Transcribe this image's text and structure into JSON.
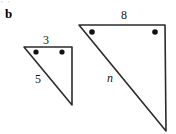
{
  "figure": {
    "part_label": "b",
    "top_crop_artifact": "1-4",
    "background_color": "#ffffff",
    "stroke_color": "#2b2b2b",
    "marker_color": "#111111",
    "label_color": "#151515",
    "small_triangle": {
      "name": "small-triangle",
      "vertices": [
        [
          24,
          47
        ],
        [
          72,
          47
        ],
        [
          72,
          105
        ]
      ],
      "side_labels": [
        {
          "text": "3",
          "x": 45,
          "y": 40,
          "side": "top"
        },
        {
          "text": "5",
          "x": 38,
          "y": 80,
          "side": "hypotenuse"
        }
      ],
      "angle_markers": [
        {
          "x": 36,
          "y": 52
        },
        {
          "x": 62,
          "y": 52
        }
      ]
    },
    "large_triangle": {
      "name": "large-triangle",
      "vertices": [
        [
          79,
          25
        ],
        [
          165,
          25
        ],
        [
          166,
          131
        ]
      ],
      "side_labels": [
        {
          "text": "8",
          "x": 124,
          "y": 16,
          "side": "top"
        },
        {
          "text": "n",
          "x": 110,
          "y": 79,
          "side": "hypotenuse",
          "italic": true
        }
      ],
      "angle_markers": [
        {
          "x": 92,
          "y": 32
        },
        {
          "x": 155,
          "y": 32
        }
      ]
    }
  }
}
